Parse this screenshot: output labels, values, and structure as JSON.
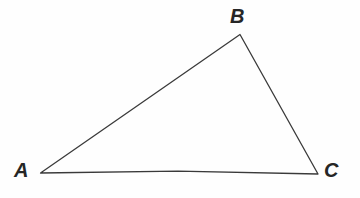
{
  "figure": {
    "name": "triangle-abc",
    "width": 360,
    "height": 198,
    "background_color": "#fefefe",
    "stroke_color": "#3a3a3a",
    "stroke_width": 1.3,
    "label_color": "#262626",
    "label_font_size": 20
  },
  "vertices": [
    {
      "id": "A",
      "label": "A",
      "x": 40,
      "y": 173,
      "label_x": 22,
      "label_y": 171
    },
    {
      "id": "B",
      "label": "B",
      "x": 240,
      "y": 34,
      "label_x": 238,
      "label_y": 17
    },
    {
      "id": "C",
      "label": "C",
      "x": 318,
      "y": 174,
      "label_x": 332,
      "label_y": 172
    }
  ],
  "edges": [
    {
      "id": "AB",
      "from": "A",
      "to": "B"
    },
    {
      "id": "BC",
      "from": "B",
      "to": "C"
    },
    {
      "id": "CA",
      "from": "C",
      "to": "A"
    }
  ],
  "paths": {
    "triangle_outline": "M 40.5 173 L 240 34.5 L 318 174 L 178 171.2 Z"
  }
}
